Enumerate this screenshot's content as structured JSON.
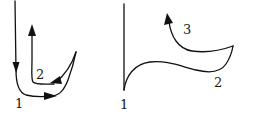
{
  "diagrams": [
    {
      "id": "left",
      "labels": [
        {
          "text": "1",
          "x": 15,
          "y": 97
        },
        {
          "text": "2",
          "x": 36,
          "y": 68
        }
      ]
    },
    {
      "id": "right",
      "labels": [
        {
          "text": "1",
          "x": 120,
          "y": 98
        },
        {
          "text": "2",
          "x": 214,
          "y": 76
        },
        {
          "text": "3",
          "x": 183,
          "y": 23
        }
      ]
    }
  ],
  "colors": {
    "stroke": "#111111",
    "background": "#ffffff"
  }
}
